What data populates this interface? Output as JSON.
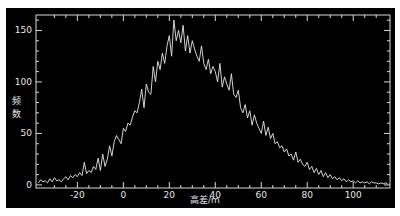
{
  "chart_data": {
    "type": "line",
    "title": "",
    "xlabel": "高差/m",
    "ylabel": "频数",
    "xlim": [
      -38,
      116
    ],
    "ylim": [
      -3,
      165
    ],
    "x_ticks": [
      -20,
      0,
      20,
      40,
      60,
      80,
      100
    ],
    "y_ticks": [
      0,
      50,
      100,
      150
    ],
    "grid": false,
    "legend": null,
    "background": "#000000",
    "line_color": "#e8e8e8",
    "series": [
      {
        "name": "频数",
        "x": [
          -37,
          -36,
          -35,
          -34,
          -33,
          -32,
          -31,
          -30,
          -29,
          -28,
          -27,
          -26,
          -25,
          -24,
          -23,
          -22,
          -21,
          -20,
          -19,
          -18,
          -17,
          -16,
          -15,
          -14,
          -13,
          -12,
          -11,
          -10,
          -9,
          -8,
          -7,
          -6,
          -5,
          -4,
          -3,
          -2,
          -1,
          0,
          1,
          2,
          3,
          4,
          5,
          6,
          7,
          8,
          9,
          10,
          11,
          12,
          13,
          14,
          15,
          16,
          17,
          18,
          19,
          20,
          21,
          22,
          23,
          24,
          25,
          26,
          27,
          28,
          29,
          30,
          31,
          32,
          33,
          34,
          35,
          36,
          37,
          38,
          39,
          40,
          41,
          42,
          43,
          44,
          45,
          46,
          47,
          48,
          49,
          50,
          51,
          52,
          53,
          54,
          55,
          56,
          57,
          58,
          59,
          60,
          61,
          62,
          63,
          64,
          65,
          66,
          67,
          68,
          69,
          70,
          71,
          72,
          73,
          74,
          75,
          76,
          77,
          78,
          79,
          80,
          81,
          82,
          83,
          84,
          85,
          86,
          87,
          88,
          89,
          90,
          91,
          92,
          93,
          94,
          95,
          96,
          97,
          98,
          99,
          100,
          101,
          102,
          103,
          104,
          105,
          106,
          107,
          108,
          109,
          110,
          111,
          112,
          113,
          114,
          115
        ],
        "values": [
          2,
          5,
          3,
          4,
          2,
          6,
          3,
          7,
          4,
          5,
          3,
          6,
          8,
          5,
          9,
          7,
          10,
          8,
          12,
          9,
          22,
          11,
          14,
          12,
          18,
          15,
          26,
          14,
          30,
          18,
          25,
          38,
          28,
          42,
          48,
          44,
          40,
          55,
          52,
          60,
          58,
          66,
          72,
          70,
          80,
          93,
          75,
          98,
          90,
          88,
          115,
          100,
          120,
          112,
          128,
          118,
          135,
          145,
          125,
          160,
          140,
          150,
          138,
          155,
          130,
          145,
          128,
          140,
          132,
          125,
          120,
          135,
          118,
          112,
          122,
          108,
          115,
          110,
          100,
          118,
          95,
          105,
          98,
          92,
          108,
          88,
          85,
          92,
          75,
          70,
          78,
          65,
          72,
          58,
          68,
          60,
          55,
          50,
          62,
          48,
          56,
          45,
          50,
          40,
          42,
          36,
          38,
          32,
          35,
          28,
          30,
          24,
          32,
          22,
          25,
          20,
          18,
          22,
          15,
          18,
          12,
          16,
          10,
          14,
          8,
          12,
          7,
          10,
          6,
          8,
          5,
          7,
          4,
          6,
          3,
          5,
          3,
          4,
          2,
          4,
          2,
          3,
          2,
          3,
          1,
          3,
          2,
          2,
          1,
          2,
          1,
          2,
          1
        ],
        "description": "Roughly bell-shaped noisy frequency distribution of elevation differences; rises from near 0 at -38 m, peaks ~160 near 18 m, decays to near 0 by ~95 m."
      }
    ]
  },
  "axes": {
    "y_label_chars": [
      "频",
      "数"
    ],
    "x_label": "高差/m",
    "y_tick_labels": [
      "0",
      "50",
      "100",
      "150"
    ],
    "x_tick_labels": [
      "-20",
      "0",
      "20",
      "40",
      "60",
      "80",
      "100"
    ]
  }
}
